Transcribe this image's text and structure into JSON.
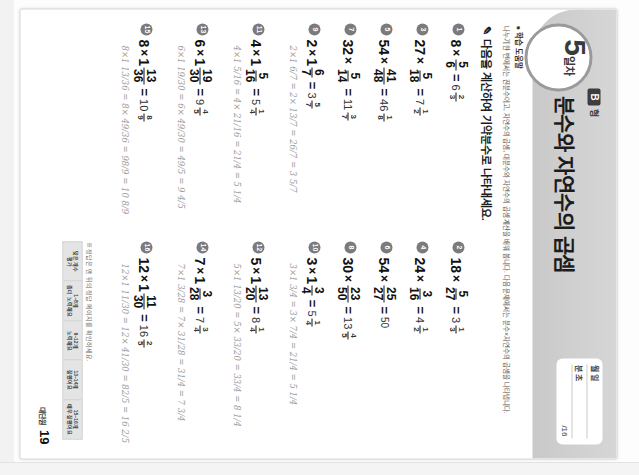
{
  "page": {
    "day_number": "5",
    "day_label": "일차",
    "type_box": "B",
    "type_text": "형",
    "title": "분수와 자연수의 곱셈",
    "score_rows": [
      {
        "key": "월  일",
        "value": ""
      },
      {
        "key": "분  초",
        "value": ""
      },
      {
        "key": "",
        "value": "/16"
      }
    ],
    "notice_head": "● 학습 도움말",
    "notice_body": "나누기 한 번에서는 진분수이고, 자연수의 곱셈, 대분수와 자연수의 곱셈 계산을 배워 봅니다. 다음 문제에서는 분수×자연수의 곱셈을 나타냅니다.",
    "instruction": "다음을 계산하여 기약분수로 나타내세요.",
    "pencil_icon": "✎",
    "footer_label": "대단원",
    "footer_page": "19",
    "key_caption": "※ 정답은 맨 뒤의 정답 페이지를 확인하세요.",
    "key_headers": [
      "맞은 개수",
      "1~8개",
      "9~12개",
      "13~14개",
      "15~16개"
    ],
    "key_values": [
      "평가",
      "좀더 노력해요",
      "노력해요",
      "잘했어요",
      "매우 잘했어요"
    ]
  },
  "problems": [
    {
      "num": "1",
      "a": "8",
      "fnum": "5",
      "fden": "6",
      "ans_whole": "6",
      "ans_num": "2",
      "ans_den": "3",
      "work": ""
    },
    {
      "num": "2",
      "a": "18",
      "fnum": "5",
      "fden": "27",
      "ans_whole": "3",
      "ans_num": "1",
      "ans_den": "3",
      "work": ""
    },
    {
      "num": "3",
      "a": "27",
      "fnum": "5",
      "fden": "18",
      "ans_whole": "7",
      "ans_num": "1",
      "ans_den": "2",
      "work": ""
    },
    {
      "num": "4",
      "a": "24",
      "fnum": "3",
      "fden": "16",
      "ans_whole": "4",
      "ans_num": "1",
      "ans_den": "2",
      "work": ""
    },
    {
      "num": "5",
      "a": "54",
      "fnum": "41",
      "fden": "48",
      "ans_whole": "46",
      "ans_num": "1",
      "ans_den": "8",
      "work": ""
    },
    {
      "num": "6",
      "a": "54",
      "fnum": "25",
      "fden": "27",
      "ans_plain": "50",
      "work": ""
    },
    {
      "num": "7",
      "a": "32",
      "fnum": "5",
      "fden": "14",
      "ans_whole": "11",
      "ans_num": "3",
      "ans_den": "7",
      "work": ""
    },
    {
      "num": "8",
      "a": "30",
      "fnum": "23",
      "fden": "50",
      "ans_whole": "13",
      "ans_num": "4",
      "ans_den": "5",
      "work": ""
    }
  ],
  "mixed_problems": [
    {
      "num": "9",
      "a": "2",
      "mwhole": "1",
      "fnum": "6",
      "fden": "7",
      "ans_whole": "3",
      "ans_num": "5",
      "ans_den": "7",
      "work": "2×1 6/7 = 2× 13/7 = 26/7 = 3 5/7"
    },
    {
      "num": "10",
      "a": "3",
      "mwhole": "1",
      "fnum": "3",
      "fden": "4",
      "ans_whole": "5",
      "ans_num": "1",
      "ans_den": "4",
      "work": "3×1 3/4 = 3× 7/4 = 21/4 = 5 1/4"
    },
    {
      "num": "11",
      "a": "4",
      "mwhole": "1",
      "fnum": "5",
      "fden": "16",
      "ans_whole": "5",
      "ans_num": "1",
      "ans_den": "4",
      "work": "4×1 5/16 = 4× 21/16 = 21/4 = 5 1/4"
    },
    {
      "num": "12",
      "a": "5",
      "mwhole": "1",
      "fnum": "13",
      "fden": "20",
      "ans_whole": "8",
      "ans_num": "1",
      "ans_den": "4",
      "work": "5×1 13/20 = 5× 33/20 = 33/4 = 8 1/4"
    },
    {
      "num": "13",
      "a": "6",
      "mwhole": "1",
      "fnum": "19",
      "fden": "30",
      "ans_whole": "9",
      "ans_num": "4",
      "ans_den": "5",
      "work": "6×1 19/30 = 6× 49/30 = 49/5 = 9 4/5"
    },
    {
      "num": "14",
      "a": "7",
      "mwhole": "1",
      "fnum": "3",
      "fden": "28",
      "ans_whole": "7",
      "ans_num": "3",
      "ans_den": "4",
      "work": "7×1 3/28 = 7× 31/28 = 31/4 = 7 3/4"
    },
    {
      "num": "15",
      "a": "8",
      "mwhole": "1",
      "fnum": "13",
      "fden": "36",
      "ans_whole": "10",
      "ans_num": "8",
      "ans_den": "9",
      "work": "8×1 13/36 = 8× 49/36 = 98/9 = 10 8/9"
    },
    {
      "num": "16",
      "a": "12",
      "mwhole": "1",
      "fnum": "11",
      "fden": "30",
      "ans_whole": "16",
      "ans_num": "2",
      "ans_den": "5",
      "work": "12×1 11/30 = 12× 41/30 = 82/5 = 16 2/5"
    }
  ]
}
